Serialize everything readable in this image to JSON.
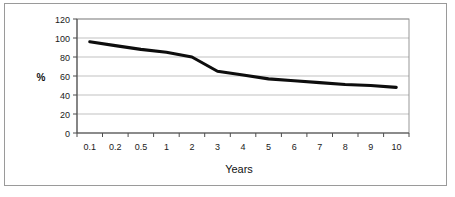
{
  "figure": {
    "frame_color": "#9a9a9a",
    "background": "#ffffff"
  },
  "chart_data": {
    "type": "line",
    "title": "",
    "subtitle": "",
    "xlabel": "Years",
    "ylabel": "%",
    "categories": [
      "0.1",
      "0.2",
      "0.5",
      "1",
      "2",
      "3",
      "4",
      "5",
      "6",
      "7",
      "8",
      "9",
      "10"
    ],
    "values": [
      96,
      92,
      88,
      85,
      80,
      65,
      61,
      57,
      55,
      53,
      51,
      50,
      48
    ],
    "series": [
      {
        "name": "",
        "color": "#0d0d0d",
        "values": [
          96,
          92,
          88,
          85,
          80,
          65,
          61,
          57,
          55,
          53,
          51,
          50,
          48
        ]
      }
    ],
    "ylim": [
      0,
      120
    ],
    "yticks": [
      0,
      20,
      40,
      60,
      80,
      100,
      120
    ],
    "ytick_labels": [
      "0",
      "20",
      "40",
      "60",
      "80",
      "100",
      "120"
    ],
    "xtick_labels": [
      "0.1",
      "0.2",
      "0.5",
      "1",
      "2",
      "3",
      "4",
      "5",
      "6",
      "7",
      "8",
      "9",
      "10"
    ],
    "grid": {
      "horizontal": true,
      "vertical": false,
      "color": "#a8a8a8"
    },
    "legend": {
      "visible": false,
      "position": "none",
      "entries": []
    },
    "annotations": [],
    "axis_scale_x": "categorical",
    "axis_scale_y": "linear"
  }
}
